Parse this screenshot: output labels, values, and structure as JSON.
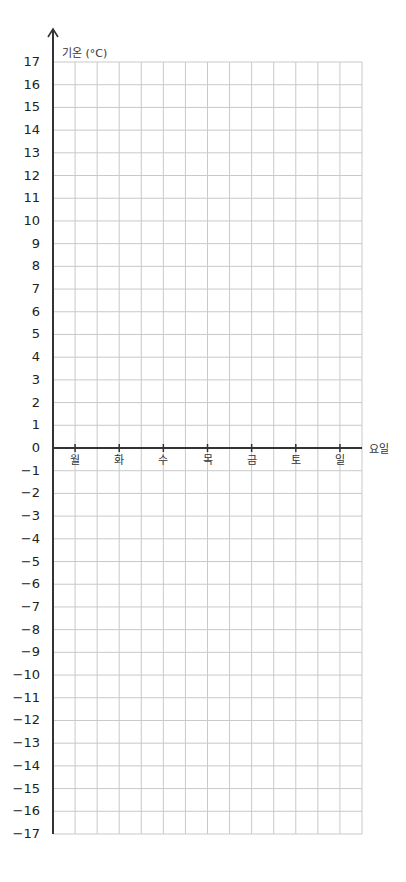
{
  "chart_data": {
    "type": "line",
    "title": "",
    "xlabel": "요일",
    "ylabel": "기온 (°C)",
    "categories": [
      "월",
      "화",
      "수",
      "목",
      "금",
      "토",
      "일"
    ],
    "series": [],
    "ylim": [
      -17,
      17
    ],
    "yticks": [
      17,
      16,
      15,
      14,
      13,
      12,
      11,
      10,
      9,
      8,
      7,
      6,
      5,
      4,
      3,
      2,
      1,
      0,
      -1,
      -2,
      -3,
      -4,
      -5,
      -6,
      -7,
      -8,
      -9,
      -10,
      -11,
      -12,
      -13,
      -14,
      -15,
      -16,
      -17
    ],
    "grid": true,
    "legend": null,
    "note": "Blank temperature graph template; no data plotted"
  },
  "colors": {
    "grid": "#c9c9c9",
    "axis": "#333333",
    "text": "#222222"
  }
}
